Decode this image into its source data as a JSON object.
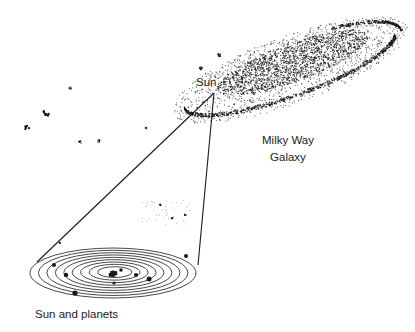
{
  "labels": {
    "sun": "Sun",
    "galaxy_line1": "Milky Way",
    "galaxy_line2": "Galaxy",
    "solar_system": "Sun and planets"
  },
  "solar_system": {
    "orbit_count": 9,
    "planet_count": 8
  },
  "colors": {
    "ink": "#1a1a1a",
    "background": "#ffffff"
  }
}
